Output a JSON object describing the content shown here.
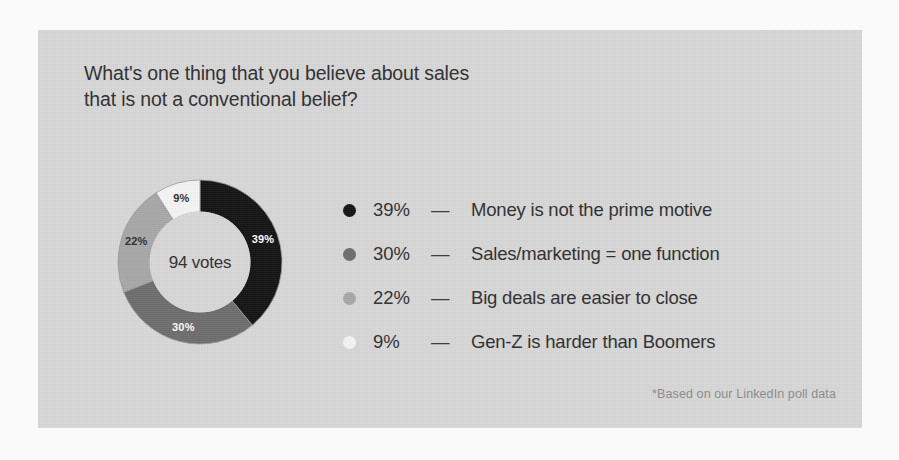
{
  "canvas": {
    "width": 899,
    "height": 460,
    "outer_background": "#fafafa",
    "card_background": "#d8d8d8"
  },
  "title": "What's one thing that you believe about sales\nthat is not a conventional belief?",
  "footnote": "*Based on our LinkedIn poll data",
  "donut": {
    "center_label": "94 votes",
    "slice_labels": [
      "39%",
      "30%",
      "22%",
      "9%"
    ]
  },
  "legend": {
    "dash": "—",
    "rows": [
      {
        "pct": "39%",
        "label": "Money is not the prime motive",
        "color": "#141414"
      },
      {
        "pct": "30%",
        "label": "Sales/marketing = one function",
        "color": "#6e6e6e"
      },
      {
        "pct": "22%",
        "label": "Big deals are easier to close",
        "color": "#a8a8a8"
      },
      {
        "pct": "9%",
        "label": "Gen-Z is harder than Boomers",
        "color": "#f5f5f5"
      }
    ]
  },
  "chart_data": {
    "type": "pie",
    "variant": "donut",
    "title": "What's one thing that you believe about sales that is not a conventional belief?",
    "subtitle": "",
    "xlabel": "",
    "ylabel": "",
    "total_votes": 94,
    "total_label": "94 votes",
    "annotation": "*Based on our LinkedIn poll data",
    "legend_position": "right",
    "grid": false,
    "start_angle_deg": 0,
    "direction": "clockwise",
    "inner_radius_ratio": 0.61,
    "categories": [
      "Money is not the prime motive",
      "Sales/marketing = one function",
      "Big deals are easier to close",
      "Gen-Z is harder than Boomers"
    ],
    "values": [
      39,
      30,
      22,
      9
    ],
    "value_labels": [
      "39%",
      "30%",
      "22%",
      "9%"
    ],
    "colors": [
      "#141414",
      "#6e6e6e",
      "#a8a8a8",
      "#f5f5f5"
    ],
    "label_text_colors": [
      "#ffffff",
      "#ffffff",
      "#2f2f2f",
      "#2f2f2f"
    ],
    "slices": [
      {
        "name": "Money is not the prime motive",
        "value": 39,
        "label": "39%",
        "color": "#141414",
        "start_deg": 0,
        "end_deg": 140.4
      },
      {
        "name": "Sales/marketing = one function",
        "value": 30,
        "label": "30%",
        "color": "#6e6e6e",
        "start_deg": 140.4,
        "end_deg": 248.4
      },
      {
        "name": "Big deals are easier to close",
        "value": 22,
        "label": "22%",
        "color": "#a8a8a8",
        "start_deg": 248.4,
        "end_deg": 327.6
      },
      {
        "name": "Gen-Z is harder than Boomers",
        "value": 9,
        "label": "9%",
        "color": "#f5f5f5",
        "start_deg": 327.6,
        "end_deg": 360
      }
    ]
  }
}
